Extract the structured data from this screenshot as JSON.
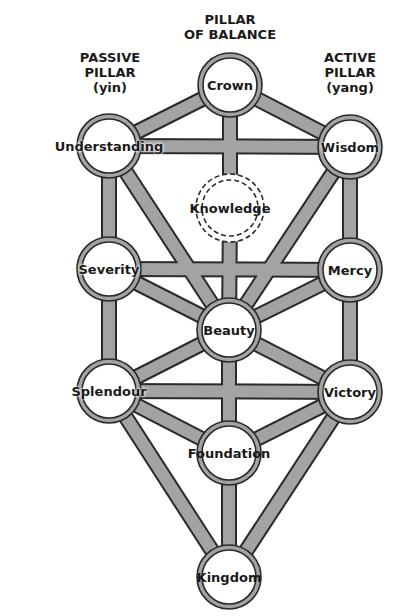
{
  "headers": {
    "balance": [
      "PILLAR",
      "OF BALANCE"
    ],
    "passive": [
      "PASSIVE",
      "PILLAR",
      "(yin)"
    ],
    "active": [
      "ACTIVE",
      "PILLAR",
      "(yang)"
    ]
  },
  "nodes": [
    {
      "id": "crown",
      "label": "Crown",
      "x": 230,
      "y": 85
    },
    {
      "id": "understanding",
      "label": "Understanding",
      "x": 109,
      "y": 146
    },
    {
      "id": "wisdom",
      "label": "Wisdom",
      "x": 350,
      "y": 147
    },
    {
      "id": "knowledge",
      "label": "Knowledge",
      "x": 230,
      "y": 208,
      "dashed": true
    },
    {
      "id": "severity",
      "label": "Severity",
      "x": 109,
      "y": 269
    },
    {
      "id": "mercy",
      "label": "Mercy",
      "x": 350,
      "y": 270
    },
    {
      "id": "beauty",
      "label": "Beauty",
      "x": 229,
      "y": 330
    },
    {
      "id": "splendour",
      "label": "Splendour",
      "x": 109,
      "y": 391
    },
    {
      "id": "victory",
      "label": "Victory",
      "x": 350,
      "y": 392
    },
    {
      "id": "foundation",
      "label": "Foundation",
      "x": 229,
      "y": 453
    },
    {
      "id": "kingdom",
      "label": "Kingdom",
      "x": 229,
      "y": 577
    }
  ],
  "colors": {
    "path": "#a3a3a3",
    "outline": "#2a2a2a",
    "node_fill": "#ffffff"
  }
}
